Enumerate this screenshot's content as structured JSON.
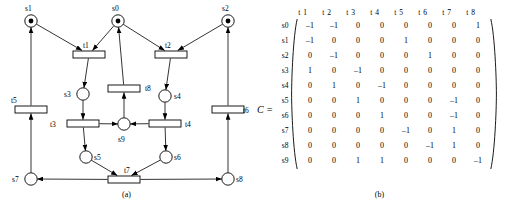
{
  "figure": {
    "caption_a": "(a)",
    "caption_b": "(b)",
    "matrix_symbol": "C ="
  },
  "petri_net": {
    "places": [
      {
        "id": "s0",
        "label": "s0",
        "cx": 118,
        "cy": 21,
        "tokens": 1,
        "lx": 112,
        "ly": 11
      },
      {
        "id": "s1",
        "label": "s1",
        "cx": 31,
        "cy": 21,
        "tokens": 1,
        "lx": 25,
        "ly": 11
      },
      {
        "id": "s2",
        "label": "s2",
        "cx": 228,
        "cy": 21,
        "tokens": 1,
        "lx": 222,
        "ly": 11
      },
      {
        "id": "s3",
        "label": "s3",
        "cx": 83,
        "cy": 94,
        "tokens": 0,
        "lx": 64,
        "ly": 97
      },
      {
        "id": "s4",
        "label": "s4",
        "cx": 165,
        "cy": 96,
        "tokens": 0,
        "lx": 174,
        "ly": 99
      },
      {
        "id": "s5",
        "label": "s5",
        "cx": 86,
        "cy": 157,
        "tokens": 0,
        "lx": 94,
        "ly": 160
      },
      {
        "id": "s6",
        "label": "s6",
        "cx": 166,
        "cy": 157,
        "tokens": 0,
        "lx": 174,
        "ly": 160
      },
      {
        "id": "s7",
        "label": "s7",
        "cx": 31,
        "cy": 179,
        "tokens": 0,
        "lx": 12,
        "ly": 182
      },
      {
        "id": "s8",
        "label": "s8",
        "cx": 228,
        "cy": 179,
        "tokens": 0,
        "lx": 236,
        "ly": 182
      },
      {
        "id": "s9",
        "label": "s9",
        "cx": 124,
        "cy": 124,
        "tokens": 0,
        "lx": 118,
        "ly": 142
      }
    ],
    "transitions": [
      {
        "id": "t1",
        "label": "t1",
        "x": 73,
        "y": 51,
        "w": 32,
        "h": 7,
        "lx": 83,
        "ly": 48
      },
      {
        "id": "t2",
        "label": "t2",
        "x": 155,
        "y": 51,
        "w": 32,
        "h": 7,
        "lx": 165,
        "ly": 48
      },
      {
        "id": "t3",
        "label": "t3",
        "x": 67,
        "y": 120,
        "w": 32,
        "h": 7,
        "lx": 50,
        "ly": 127
      },
      {
        "id": "t4",
        "label": "t4",
        "x": 149,
        "y": 120,
        "w": 32,
        "h": 7,
        "lx": 185,
        "ly": 127
      },
      {
        "id": "t5",
        "label": "t5",
        "x": 15,
        "y": 106,
        "w": 32,
        "h": 7,
        "lx": 11,
        "ly": 103
      },
      {
        "id": "t6",
        "label": "t6",
        "x": 212,
        "y": 106,
        "w": 32,
        "h": 7,
        "lx": 243,
        "ly": 113
      },
      {
        "id": "t7",
        "label": "t7",
        "x": 108,
        "y": 176,
        "w": 32,
        "h": 7,
        "lx": 124,
        "ly": 173
      },
      {
        "id": "t8",
        "label": "t8",
        "x": 108,
        "y": 85,
        "w": 32,
        "h": 7,
        "lx": 145,
        "ly": 91
      }
    ],
    "arcs": [
      {
        "from": "s1",
        "to": "t1"
      },
      {
        "from": "s0",
        "to": "t1"
      },
      {
        "from": "s0",
        "to": "t2"
      },
      {
        "from": "s2",
        "to": "t2"
      },
      {
        "from": "t1",
        "to": "s3"
      },
      {
        "from": "t2",
        "to": "s4"
      },
      {
        "from": "s3",
        "to": "t3"
      },
      {
        "from": "s4",
        "to": "t4"
      },
      {
        "from": "t3",
        "to": "s9"
      },
      {
        "from": "t4",
        "to": "s9"
      },
      {
        "from": "t3",
        "to": "s5"
      },
      {
        "from": "t4",
        "to": "s6"
      },
      {
        "from": "s9",
        "to": "t8"
      },
      {
        "from": "t8",
        "to": "s0"
      },
      {
        "from": "s5",
        "to": "t7"
      },
      {
        "from": "s6",
        "to": "t7"
      },
      {
        "from": "t7",
        "to": "s7"
      },
      {
        "from": "t7",
        "to": "s8"
      },
      {
        "from": "s7",
        "to": "t5"
      },
      {
        "from": "t5",
        "to": "s1"
      },
      {
        "from": "s8",
        "to": "t6"
      },
      {
        "from": "t6",
        "to": "s2"
      }
    ]
  },
  "chart_data": {
    "type": "table",
    "title": "C =",
    "columns": [
      "t 1",
      "t 2",
      "t 3",
      "t 4",
      "t 5",
      "t 6",
      "t 7",
      "t 8"
    ],
    "rows": [
      "s0",
      "s1",
      "s2",
      "s3",
      "s4",
      "s5",
      "s6",
      "s7",
      "s8",
      "s9"
    ],
    "values": [
      [
        -1,
        -1,
        0,
        0,
        0,
        0,
        0,
        1
      ],
      [
        -1,
        0,
        0,
        0,
        1,
        0,
        0,
        0
      ],
      [
        0,
        -1,
        0,
        0,
        0,
        1,
        0,
        0
      ],
      [
        1,
        0,
        -1,
        0,
        0,
        0,
        0,
        0
      ],
      [
        0,
        1,
        0,
        -1,
        0,
        0,
        0,
        0
      ],
      [
        0,
        0,
        1,
        0,
        0,
        0,
        -1,
        0
      ],
      [
        0,
        0,
        0,
        1,
        0,
        0,
        -1,
        0
      ],
      [
        0,
        0,
        0,
        0,
        -1,
        0,
        1,
        0
      ],
      [
        0,
        0,
        0,
        0,
        0,
        -1,
        1,
        0
      ],
      [
        0,
        0,
        1,
        1,
        0,
        0,
        0,
        -1
      ]
    ]
  }
}
